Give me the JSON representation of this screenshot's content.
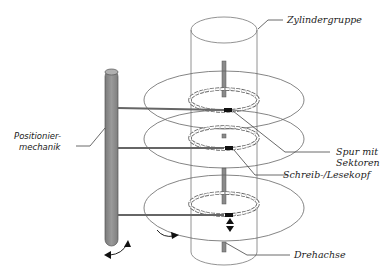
{
  "diagram": {
    "type": "hard-disk-structure",
    "labels": {
      "cylinder_group": "Zylindergruppe",
      "track_line1": "Spur mit",
      "track_line2": "Sektoren",
      "head": "Schreib-/Lesekopf",
      "spindle": "Drehachse",
      "positioner_line1": "Positionier-",
      "positioner_line2": "mechanik"
    },
    "platters": [
      {
        "name": "platter-1",
        "cx": 224,
        "cy": 100,
        "rx": 80,
        "ry": 29
      },
      {
        "name": "platter-2",
        "cx": 224,
        "cy": 139,
        "rx": 80,
        "ry": 29
      },
      {
        "name": "platter-3",
        "cx": 224,
        "cy": 206,
        "rx": 80,
        "ry": 33
      }
    ],
    "colors": {
      "line": "#555555",
      "rod_fill": "#8c8c8c",
      "rod_top": "#a8a8a8",
      "head": "#111111",
      "ring": "#d9d9d9"
    }
  }
}
